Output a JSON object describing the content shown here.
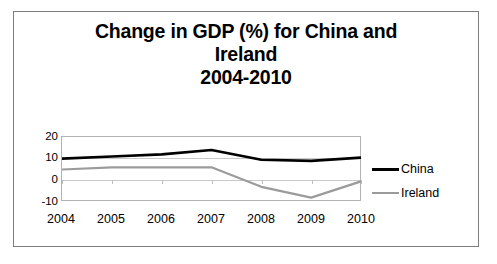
{
  "chart_data": {
    "type": "line",
    "title": "Change in GDP (%) for China and Ireland 2004-2010",
    "title_lines": [
      "Change in GDP (%) for China and",
      "Ireland",
      "2004-2010"
    ],
    "xlabel": "",
    "ylabel": "",
    "categories": [
      "2004",
      "2005",
      "2006",
      "2007",
      "2008",
      "2009",
      "2010"
    ],
    "x": [
      2004,
      2005,
      2006,
      2007,
      2008,
      2009,
      2010
    ],
    "series": [
      {
        "name": "China",
        "color": "#000000",
        "values": [
          10,
          11,
          12,
          14,
          9.5,
          9,
          10.5
        ]
      },
      {
        "name": "Ireland",
        "color": "#9b9b9b",
        "values": [
          5,
          6,
          6,
          6,
          -3,
          -8,
          -0.5
        ]
      }
    ],
    "ylim": [
      -10,
      20
    ],
    "yticks": [
      20,
      10,
      0,
      -10
    ],
    "ytick_labels": [
      "20",
      "10",
      "0",
      "-10"
    ],
    "grid": true,
    "legend_position": "right"
  },
  "legend": {
    "entries": [
      {
        "label": "China",
        "swatch": "line-swatch-black"
      },
      {
        "label": "Ireland",
        "swatch": "line-swatch-gray"
      }
    ]
  },
  "axes": {
    "y_tick_labels": [
      "20",
      "10",
      "0",
      "-10"
    ],
    "x_tick_labels": [
      "2004",
      "2005",
      "2006",
      "2007",
      "2008",
      "2009",
      "2010"
    ]
  }
}
